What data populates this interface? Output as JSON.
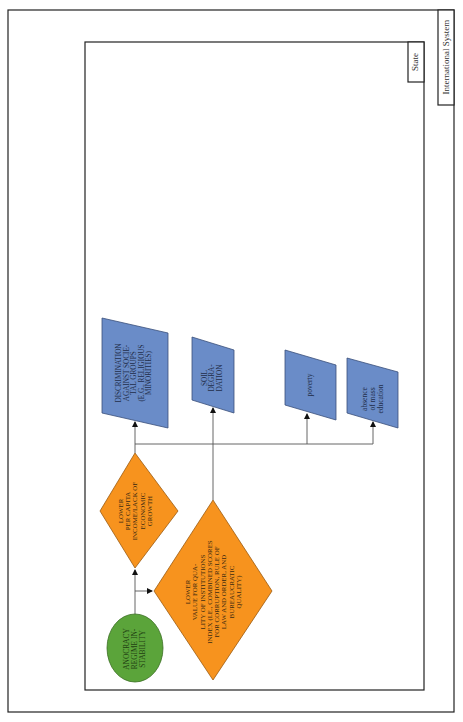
{
  "frames": {
    "outer": {
      "label": "International System"
    },
    "inner": {
      "label": "State"
    }
  },
  "colors": {
    "cause_oval": "#5ba43a",
    "factor_diamond": "#f7931e",
    "outcome_box": "#6a8cc8",
    "line": "#555555",
    "frame": "#222222"
  },
  "nodes": {
    "anocracy": {
      "label": "ANOCRACY REGIME IN-STABILITY",
      "lines": [
        "ANOCRACY",
        "REGIME IN-",
        "STABILITY"
      ],
      "shape": "oval"
    },
    "income": {
      "label": "LOWER PER CAPITA INCOME/LACK OF ECONOMIC GROWTH",
      "lines": [
        "LOWER",
        "PER CAPITA",
        "INCOME/LACK OF",
        "ECONOMIC",
        "GROWTH"
      ],
      "shape": "diamond"
    },
    "institutions": {
      "label": "LOWER VALUE FOR QUALITY OF INSTITUTIONS INDEX (I.E., COMBINED SCORES FOR CORRUPTION, RULE OF LAW AND ORDER, AND BUREAUCRATIC QUALITY)",
      "lines": [
        "LOWER",
        "VALUE FOR QUA-",
        "LITY OF INSTITUTIONS",
        "INDEX (I.E., COMBINED SCORES",
        "FOR CORRUPTION, RULE OF",
        "LAW AND ORDER, AND",
        "BUREAUCRATIC",
        "QUALITY)"
      ],
      "shape": "diamond"
    },
    "discrimination": {
      "label": "DISCRIMINATION AGAINST SOCIETAL GROUPS (E.G., RELIGIOUS MINORITIES)",
      "lines": [
        "DISCRIMINATION",
        "AGAINST SOCIE-",
        "TAL GROUPS",
        "(E.G., RELIGIOUS",
        "MINORITIES)"
      ],
      "shape": "parallelogram"
    },
    "soil": {
      "label": "SOIL DEGRADATION",
      "lines": [
        "SOIL",
        "DEGRA-",
        "DATION"
      ],
      "shape": "parallelogram"
    },
    "poverty": {
      "label": "poverty",
      "lines": [
        "poverty"
      ],
      "shape": "parallelogram"
    },
    "education": {
      "label": "absence of mass education",
      "lines": [
        "absence",
        "of mass",
        "education"
      ],
      "shape": "parallelogram"
    }
  },
  "edges": [
    {
      "from": "anocracy",
      "to": "income"
    },
    {
      "from": "anocracy",
      "to": "institutions"
    },
    {
      "from": "income",
      "to": "discrimination"
    },
    {
      "from": "income",
      "to": "poverty"
    },
    {
      "from": "income",
      "to": "education"
    },
    {
      "from": "institutions",
      "to": "soil"
    }
  ]
}
